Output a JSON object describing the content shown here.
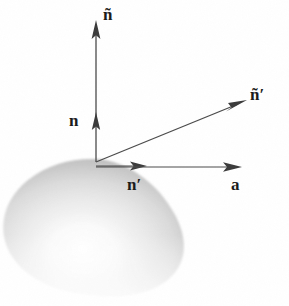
{
  "figure": {
    "background_color": "#ffffff",
    "stroke_color": "#444444",
    "label_color": "#1a1a1a",
    "width": 289,
    "height": 306
  },
  "surface": {
    "name": "shaded-blob",
    "description": "Rounded triangular shaded solid (surface patch)",
    "fill_light": "#fdfdfd",
    "fill_mid": "#d8d8d8",
    "fill_dark": "#a6a6a6",
    "highlight_center": {
      "x": 86,
      "y": 246
    }
  },
  "origin": {
    "x": 96,
    "y": 162
  },
  "vectors": [
    {
      "id": "n-tilde",
      "label": "ñ",
      "label_base": "n",
      "accent": "tilde",
      "prime": "",
      "from": {
        "x": 96,
        "y": 162
      },
      "to": {
        "x": 96,
        "y": 22
      },
      "label_pos": {
        "x": 103,
        "y": 6
      }
    },
    {
      "id": "n",
      "label": "n",
      "label_base": "n",
      "accent": "none",
      "prime": "",
      "from": {
        "x": 96,
        "y": 162
      },
      "to": {
        "x": 96,
        "y": 118
      },
      "label_pos": {
        "x": 69,
        "y": 112
      }
    },
    {
      "id": "n-prime",
      "label": "n′",
      "label_base": "n",
      "accent": "none",
      "prime": "′",
      "from": {
        "x": 96,
        "y": 166
      },
      "to": {
        "x": 146,
        "y": 166
      },
      "label_pos": {
        "x": 127,
        "y": 176
      }
    },
    {
      "id": "n-tilde-prime",
      "label": "ñ′",
      "label_base": "n",
      "accent": "tilde",
      "prime": "′",
      "from": {
        "x": 96,
        "y": 162
      },
      "to": {
        "x": 246,
        "y": 101
      },
      "label_pos": {
        "x": 250,
        "y": 86
      }
    },
    {
      "id": "a",
      "label": "a",
      "label_base": "a",
      "accent": "none",
      "prime": "",
      "from": {
        "x": 96,
        "y": 167
      },
      "to": {
        "x": 241,
        "y": 167
      },
      "label_pos": {
        "x": 231,
        "y": 176
      }
    }
  ]
}
